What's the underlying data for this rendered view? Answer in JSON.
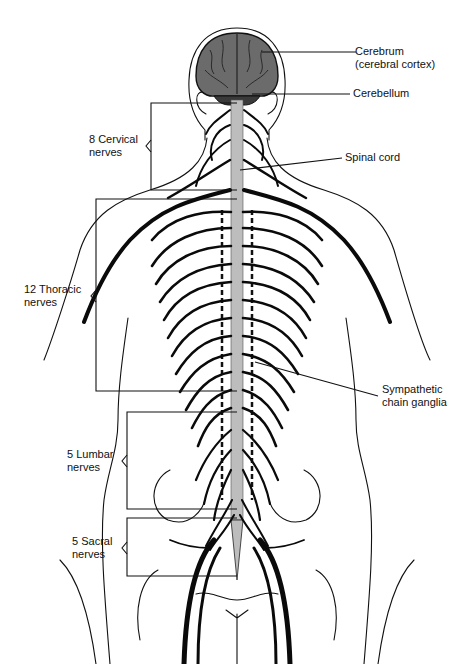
{
  "diagram": {
    "colors": {
      "line": "#111111",
      "brain_fill": "#6b6b6b",
      "cord_fill": "#bdbdbd",
      "background": "#ffffff"
    }
  },
  "labels": {
    "cerebrum": {
      "line1": "Cerebrum",
      "line2": "(cerebral cortex)"
    },
    "cerebellum": {
      "line1": "Cerebellum"
    },
    "spinal_cord": {
      "line1": "Spinal cord"
    },
    "sympathetic": {
      "line1": "Sympathetic",
      "line2": "chain ganglia"
    },
    "cervical": {
      "line1": "8 Cervical",
      "line2": "nerves"
    },
    "thoracic": {
      "line1": "12 Thoracic",
      "line2": "nerves"
    },
    "lumbar": {
      "line1": "5 Lumbar",
      "line2": "nerves"
    },
    "sacral": {
      "line1": "5 Sacral",
      "line2": "nerves"
    }
  }
}
